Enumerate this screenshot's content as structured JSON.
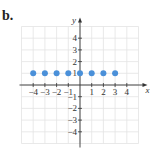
{
  "figure": {
    "label": "b."
  },
  "chart_data": {
    "type": "scatter",
    "title": "",
    "xlabel": "x",
    "ylabel": "y",
    "x": [
      -4,
      -3,
      -2,
      -1,
      0,
      1,
      2,
      3
    ],
    "y": [
      1,
      1,
      1,
      1,
      1,
      1,
      1,
      1
    ],
    "xlim": [
      -5,
      5
    ],
    "ylim": [
      -5,
      5
    ],
    "x_ticks": [
      -4,
      -3,
      -2,
      -1,
      1,
      2,
      3,
      4
    ],
    "y_ticks": [
      4,
      3,
      2,
      1,
      -1,
      -2,
      -3,
      -4
    ],
    "x_tick_labels": [
      "−4",
      "−3",
      "−2",
      "−1",
      "1",
      "2",
      "3",
      "4"
    ],
    "y_tick_labels": [
      "4",
      "3",
      "2",
      "1",
      "−1",
      "−2",
      "−3",
      "−4"
    ],
    "grid": true,
    "point_color": "#4a90d9"
  }
}
